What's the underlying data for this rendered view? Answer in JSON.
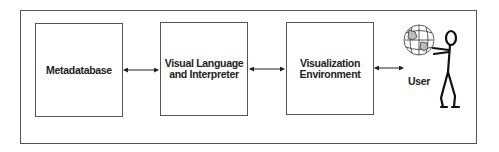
{
  "diagram": {
    "nodes": [
      {
        "id": "metadatabase",
        "lines": [
          "Metadatabase"
        ]
      },
      {
        "id": "visual-language",
        "lines": [
          "Visual Language",
          "and Interpreter"
        ]
      },
      {
        "id": "visualization-env",
        "lines": [
          "Visualization",
          "Environment"
        ]
      },
      {
        "id": "user",
        "label": "User",
        "icon": "stick-figure-holding-globe"
      }
    ],
    "edges": [
      {
        "from": "metadatabase",
        "to": "visual-language",
        "type": "bidirectional"
      },
      {
        "from": "visual-language",
        "to": "visualization-env",
        "type": "bidirectional"
      },
      {
        "from": "visualization-env",
        "to": "user",
        "type": "bidirectional"
      }
    ]
  }
}
